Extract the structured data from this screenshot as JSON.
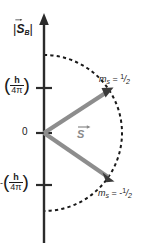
{
  "figure": {
    "name": "spin-angular-momentum-vector-diagram",
    "background_color": "#ffffff",
    "axis_color": "#2b2b2b",
    "arc_color": "#1a1a1a",
    "vector_color": "#8d8d8d",
    "arrowhead_color": "#3a3a3a"
  },
  "axis": {
    "title_bar_left": "|",
    "title_symbol": "S",
    "title_subscript": "B",
    "title_bar_right": "|",
    "title_plain": "|S⃗B|",
    "orientation": "vertical",
    "arrow_at_top": true
  },
  "ticks": [
    {
      "id": "tick-positive",
      "value_plain": "(h/4π)",
      "sign": "",
      "numerator": "h",
      "denominator": "4π",
      "paren_open": "(",
      "paren_close": ")",
      "y_px": 88
    },
    {
      "id": "tick-zero",
      "value_plain": "0",
      "label": "0",
      "y_px": 133
    },
    {
      "id": "tick-negative",
      "value_plain": "-(h/4π)",
      "sign": "-",
      "numerator": "h",
      "denominator": "4π",
      "paren_open": "(",
      "paren_close": ")",
      "y_px": 185
    }
  ],
  "vectors": [
    {
      "id": "spin-up-vector",
      "label_var": "m",
      "label_sub": "s",
      "label_eq": " = ",
      "sign": "",
      "numerator": "1",
      "slash": "/",
      "denominator": "2",
      "label_plain": "mₛ = 1/2",
      "from": [
        44,
        133
      ],
      "to": [
        112,
        89
      ]
    },
    {
      "id": "spin-down-vector",
      "label_var": "m",
      "label_sub": "s",
      "label_eq": " = ",
      "sign": "-",
      "numerator": "1",
      "slash": "/",
      "denominator": "2",
      "label_plain": "mₛ = -1/2",
      "from": [
        44,
        133
      ],
      "to": [
        113,
        181
      ]
    }
  ],
  "resultant": {
    "id": "s-vector",
    "label": "S",
    "label_plain": "S⃗",
    "color": "#8a8a8a"
  },
  "arc": {
    "id": "dashed-semicircle",
    "center": [
      44,
      133
    ],
    "radius": 78,
    "style": "dashed",
    "spans": "upper and lower half, right side of axis"
  }
}
